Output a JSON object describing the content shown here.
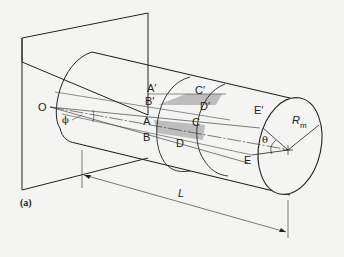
{
  "figure": {
    "panel_label": "(a)",
    "points": {
      "O": "O",
      "A": "A",
      "A_prime": "A′",
      "B": "B",
      "B_prime": "B′",
      "C": "C",
      "C_prime": "C′",
      "D": "D",
      "D_prime": "D′",
      "E": "E",
      "E_prime": "E′"
    },
    "angles": {
      "phi": "ϕ",
      "theta": "θ"
    },
    "dimensions": {
      "length": "L",
      "radius_main": "R",
      "radius_sub": "m"
    },
    "colors": {
      "line": "#222222",
      "shade": "#bdbdbd",
      "background": "#f4f4f2"
    }
  }
}
